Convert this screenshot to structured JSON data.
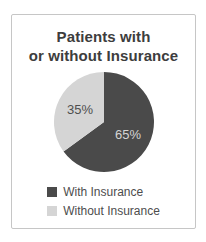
{
  "header": {
    "title_lines": [
      "Patients with",
      "or without Insurance"
    ]
  },
  "card": {
    "border_color": "#c6c6c6",
    "background": "#ffffff"
  },
  "chart_data": {
    "type": "pie",
    "title": "Patients with or without Insurance",
    "categories": [
      "With Insurance",
      "Without Insurance"
    ],
    "values": [
      65,
      35
    ],
    "slice_labels": [
      "65%",
      "35%"
    ],
    "colors": [
      "#4a4a4a",
      "#d5d5d5"
    ],
    "slice_label_colors": [
      "#d4d4d4",
      "#4f4f4f"
    ],
    "start_angle_deg": 0,
    "direction": "clockwise",
    "legend_position": "bottom",
    "title_color": "#3d3d3d",
    "legend_text_color": "#4d4d4d"
  }
}
